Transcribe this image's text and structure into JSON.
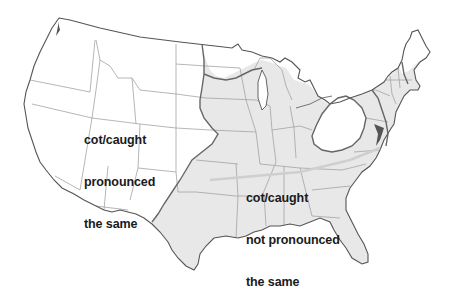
{
  "map": {
    "type": "choropleth-region",
    "subject": "Cot/caught merger in the contiguous United States",
    "colors": {
      "background": "#ffffff",
      "merged_region_fill": "#ffffff",
      "distinct_region_fill": "#e8e8e8",
      "state_border": "#9a9a9a",
      "coastline": "#555555",
      "isogloss_line": "#666666",
      "label_text": "#1a1a1a"
    },
    "regions": [
      {
        "id": "merged",
        "label_lines": [
          "cot/caught",
          "pronounced",
          "the same"
        ],
        "shading": "unshaded (white)",
        "area": "Western US, Canadian border states, western Pennsylvania island"
      },
      {
        "id": "distinct",
        "label_lines": [
          "cot/caught",
          "not pronounced",
          "the same"
        ],
        "shading": "light gray",
        "area": "Eastern and southern US from Texas to the Atlantic, excluding northern New England"
      }
    ]
  },
  "labels": {
    "merged": {
      "line1": "cot/caught",
      "line2": "pronounced",
      "line3": "the same"
    },
    "distinct": {
      "line1": "cot/caught",
      "line2": "not pronounced",
      "line3": "the same"
    }
  }
}
